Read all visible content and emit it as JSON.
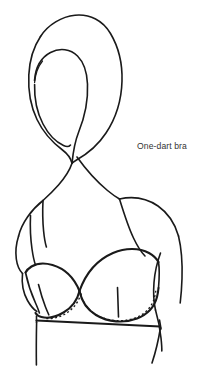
{
  "illustration": {
    "title": "One-dart bra",
    "caption": "One-dart bra",
    "subject": "fashion line drawing of female torso wearing a bra",
    "style": "black line art on white background",
    "colors": {
      "background": "#ffffff",
      "ink": "#1a1a1a",
      "caption_text": "#333333"
    },
    "caption_position": {
      "x": 137,
      "y": 149
    },
    "parts": [
      {
        "name": "hair-outline",
        "label": "Hair outline"
      },
      {
        "name": "face-contour",
        "label": "Face contour"
      },
      {
        "name": "neck",
        "label": "Neck"
      },
      {
        "name": "left-shoulder",
        "label": "Left shoulder"
      },
      {
        "name": "right-shoulder",
        "label": "Right shoulder"
      },
      {
        "name": "left-arm",
        "label": "Left arm"
      },
      {
        "name": "right-arm",
        "label": "Right arm"
      },
      {
        "name": "bra-left-cup",
        "label": "Left bra cup"
      },
      {
        "name": "bra-right-cup",
        "label": "Right bra cup"
      },
      {
        "name": "bra-strap-left",
        "label": "Left bra strap"
      },
      {
        "name": "bra-strap-right",
        "label": "Right bra strap"
      },
      {
        "name": "bust-dart",
        "label": "Bust dart"
      },
      {
        "name": "cup-stitching",
        "label": "Cup stitching line"
      },
      {
        "name": "bra-band",
        "label": "Bra band"
      },
      {
        "name": "torso",
        "label": "Torso"
      }
    ]
  }
}
